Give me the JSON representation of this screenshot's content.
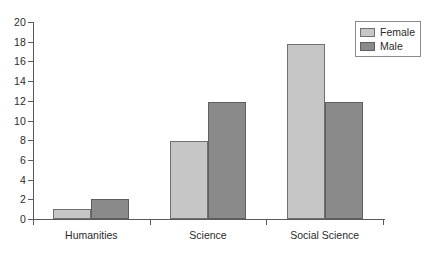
{
  "chart_data": {
    "type": "bar",
    "title": "",
    "subtitle": "",
    "xlabel": "",
    "ylabel": "",
    "categories": [
      "Humanities",
      "Science",
      "Social Science"
    ],
    "series": [
      {
        "name": "Female",
        "color": "#c6c6c6",
        "values": [
          1,
          7.9,
          17.8
        ]
      },
      {
        "name": "Male",
        "color": "#8a8a8a",
        "values": [
          2,
          11.9,
          11.9
        ]
      }
    ],
    "ylim": [
      0,
      20
    ],
    "ytick_step": 2,
    "ytick_labels": [
      "0",
      "2",
      "4",
      "6",
      "8",
      "10",
      "12",
      "14",
      "16",
      "18",
      "20"
    ],
    "grid": false,
    "legend_position": "top-right",
    "axis_color": "#5a5a5a",
    "bar_border_color": "#707070",
    "background": "#ffffff"
  },
  "legend": {
    "entries": [
      {
        "label": "Female",
        "swatch": "legend-swatch-female"
      },
      {
        "label": "Male",
        "swatch": "legend-swatch-male"
      }
    ]
  }
}
